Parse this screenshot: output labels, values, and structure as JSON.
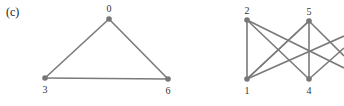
{
  "panel_label": "(c)",
  "graph_left": {
    "nodes": [
      {
        "id": "0",
        "label": "0",
        "x": 109,
        "y": 19,
        "lx": 109,
        "ly": 12
      },
      {
        "id": "3",
        "label": "3",
        "x": 45,
        "y": 78,
        "lx": 45,
        "ly": 93
      },
      {
        "id": "6",
        "label": "6",
        "x": 168,
        "y": 79,
        "lx": 168,
        "ly": 94
      }
    ],
    "edges": [
      [
        "0",
        "3"
      ],
      [
        "0",
        "6"
      ],
      [
        "3",
        "6"
      ]
    ]
  },
  "graph_right": {
    "nodes": [
      {
        "id": "2",
        "label": "2",
        "x": 247,
        "y": 20,
        "lx": 247,
        "ly": 14
      },
      {
        "id": "5",
        "label": "5",
        "x": 309,
        "y": 21,
        "lx": 309,
        "ly": 15
      },
      {
        "id": "1",
        "label": "1",
        "x": 247,
        "y": 79,
        "lx": 247,
        "ly": 94
      },
      {
        "id": "4",
        "label": "4",
        "x": 309,
        "y": 79,
        "lx": 309,
        "ly": 94
      }
    ],
    "edges": [
      [
        "2",
        "1"
      ],
      [
        "2",
        "4"
      ],
      [
        "5",
        "1"
      ],
      [
        "5",
        "4"
      ],
      [
        "1",
        "5"
      ]
    ],
    "offscreen_edges": [
      {
        "from": "2",
        "to_x": 344,
        "to_y": 68
      },
      {
        "from": "1",
        "to_x": 344,
        "to_y": 36
      },
      {
        "from": "5",
        "to_x": 344,
        "to_y": 56
      },
      {
        "from": "4",
        "to_x": 344,
        "to_y": 48
      }
    ]
  }
}
